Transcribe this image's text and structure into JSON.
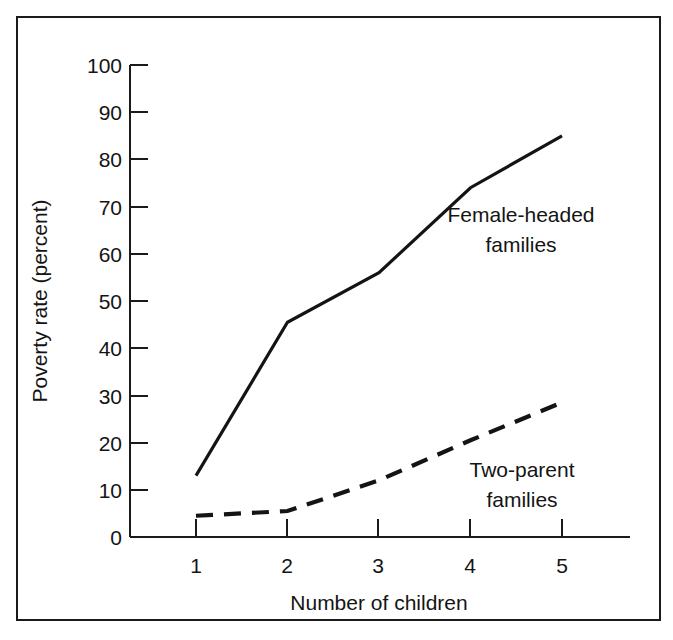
{
  "chart_data": {
    "type": "line",
    "title": "",
    "xlabel": "Number of children",
    "ylabel": "Poverty rate (percent)",
    "x": [
      1,
      2,
      3,
      4,
      5
    ],
    "xtick_labels": [
      "1",
      "2",
      "3",
      "4",
      "5"
    ],
    "ytick_labels": [
      "0",
      "10",
      "20",
      "30",
      "40",
      "50",
      "60",
      "70",
      "80",
      "90",
      "100"
    ],
    "yticks": [
      0,
      10,
      20,
      30,
      40,
      50,
      60,
      70,
      80,
      90,
      100
    ],
    "xlim": [
      0.45,
      5.55
    ],
    "ylim": [
      0,
      100
    ],
    "grid": false,
    "legend_position": "inline-annotations",
    "series": [
      {
        "name": "Female-headed families",
        "style": "solid",
        "values": [
          13,
          45.5,
          56,
          74,
          85
        ],
        "annotation": {
          "line1": "Female-headed",
          "line2": "families"
        }
      },
      {
        "name": "Two-parent families",
        "style": "dashed",
        "values": [
          4.5,
          5.5,
          12,
          20.5,
          28.5
        ],
        "annotation": {
          "line1": "Two-parent",
          "line2": "families"
        }
      }
    ]
  },
  "figure": {
    "axis_color": "#1a1a1a",
    "text_color": "#141414",
    "background": "#ffffff",
    "border_color": "#1a1a1a"
  }
}
